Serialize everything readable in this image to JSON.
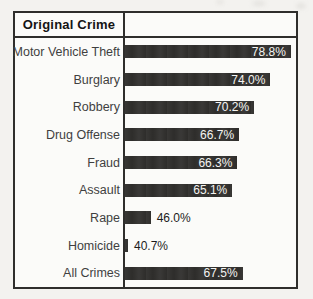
{
  "header": {
    "title": "Original Crime"
  },
  "colors": {
    "page_background": "#f3f2ef",
    "chart_background": "#fbfbf9",
    "frame_border": "#2f2e2c",
    "bar_fill": "#2e2d2b",
    "row_label_text": "#3f3f3f",
    "value_inside_text": "#f4f4f2",
    "value_outside_text": "#1c1c1c"
  },
  "chart_data": {
    "type": "bar",
    "orientation": "horizontal",
    "title": "Original Crime",
    "categories": [
      "Motor Vehicle Theft",
      "Burglary",
      "Robbery",
      "Drug Offense",
      "Fraud",
      "Assault",
      "Rape",
      "Homicide",
      "All Crimes"
    ],
    "values": [
      78.8,
      74.0,
      70.2,
      66.7,
      66.3,
      65.1,
      46.0,
      40.7,
      67.5
    ],
    "value_labels": [
      "78.8%",
      "74.0%",
      "70.2%",
      "66.7%",
      "66.3%",
      "65.1%",
      "46.0%",
      "40.7%",
      "67.5%"
    ],
    "xlabel": "",
    "ylabel": "Original Crime",
    "xlim": [
      40,
      80
    ],
    "grid": false,
    "legend": false,
    "value_label_placement_rule": "inside-right when bar is long, outside-right in black when bar is short"
  }
}
